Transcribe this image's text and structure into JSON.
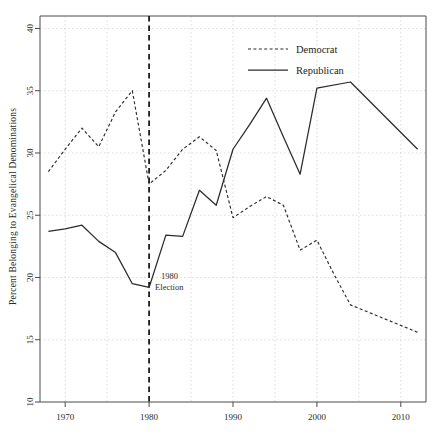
{
  "chart_data": {
    "type": "line",
    "title": "",
    "subtitle": "",
    "xlabel": "",
    "ylabel": "Percent Belonging to Evangelical Denominations",
    "xlim": [
      1967,
      2013
    ],
    "ylim": [
      10,
      41
    ],
    "xticks": [
      1970,
      1980,
      1990,
      2000,
      2010
    ],
    "xtick_labels": [
      "1970",
      "1980",
      "1990",
      "2000",
      "2010"
    ],
    "yticks": [
      10,
      15,
      20,
      25,
      30,
      35,
      40
    ],
    "ytick_labels": [
      "10",
      "15",
      "20",
      "25",
      "30",
      "35",
      "40"
    ],
    "grid": true,
    "legend_position": "top-center-right",
    "legend": [
      {
        "name": "Democrat",
        "style": "dashed"
      },
      {
        "name": "Republican",
        "style": "solid"
      }
    ],
    "annotations": [
      {
        "name": "election-marker",
        "line1": "1980",
        "line2": "Election",
        "x": 1980,
        "y": 20.0,
        "type": "vline-label"
      }
    ],
    "series": [
      {
        "name": "Democrat",
        "style": "dashed",
        "color": "#2b2b2b",
        "x": [
          1968,
          1970,
          1972,
          1974,
          1976,
          1978,
          1980,
          1982,
          1984,
          1986,
          1988,
          1990,
          1992,
          1994,
          1996,
          1998,
          2000,
          2002,
          2004,
          2008,
          2012
        ],
        "values": [
          28.5,
          30.3,
          32.0,
          30.5,
          33.3,
          35.0,
          27.5,
          28.6,
          30.3,
          31.3,
          30.2,
          24.8,
          25.7,
          26.5,
          25.8,
          22.2,
          23.0,
          20.3,
          17.8,
          16.7,
          15.6
        ]
      },
      {
        "name": "Republican",
        "style": "solid",
        "color": "#2b2b2b",
        "x": [
          1968,
          1970,
          1972,
          1974,
          1976,
          1978,
          1980,
          1982,
          1984,
          1986,
          1988,
          1990,
          1992,
          1994,
          1996,
          1998,
          2000,
          2004,
          2012
        ],
        "values": [
          23.7,
          23.9,
          24.2,
          22.9,
          22.0,
          19.5,
          19.2,
          23.4,
          23.3,
          27.0,
          25.8,
          30.3,
          32.3,
          34.4,
          31.3,
          28.3,
          35.2,
          35.7,
          30.3
        ]
      }
    ]
  }
}
